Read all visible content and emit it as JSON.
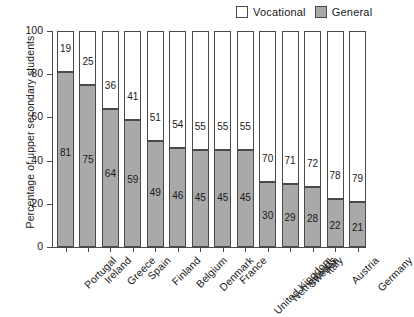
{
  "chart_data": {
    "type": "bar",
    "stacked": true,
    "title": "",
    "xlabel": "",
    "ylabel": "Percentage of upper secondary students",
    "ylim": [
      0,
      100
    ],
    "yticks": [
      0,
      20,
      40,
      60,
      80,
      100
    ],
    "grid": false,
    "legend_position": "top-right",
    "categories": [
      "Portugal",
      "Ireland",
      "Greece",
      "Spain",
      "Finland",
      "Belgium",
      "Denmark",
      "France",
      "United Kingdom",
      "Netherlands",
      "Sweden",
      "Italy",
      "Austria",
      "Germany"
    ],
    "series": [
      {
        "name": "General",
        "color": "#a9a9a9",
        "values": [
          81,
          75,
          64,
          59,
          49,
          46,
          45,
          45,
          45,
          30,
          29,
          28,
          22,
          21
        ]
      },
      {
        "name": "Vocational",
        "color": "#ffffff",
        "values": [
          19,
          25,
          36,
          41,
          51,
          54,
          55,
          55,
          55,
          70,
          71,
          72,
          78,
          79
        ]
      }
    ]
  },
  "legend": {
    "items": [
      {
        "label": "Vocational",
        "swatch": "white"
      },
      {
        "label": "General",
        "swatch": "gray"
      }
    ]
  },
  "axes": {
    "y_title": "Percentage of upper secondary students",
    "y_ticks": [
      "0",
      "20",
      "40",
      "60",
      "80",
      "100"
    ]
  }
}
